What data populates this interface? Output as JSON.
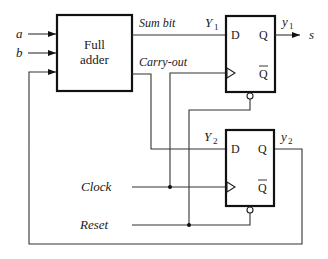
{
  "diagram": {
    "type": "sequential-circuit",
    "full_adder": {
      "label_line1": "Full",
      "label_line2": "adder"
    },
    "inputs": {
      "a": "a",
      "b": "b",
      "clock": "Clock",
      "reset": "Reset"
    },
    "signals": {
      "sum_bit": "Sum bit",
      "carry_out": "Carry-out",
      "Y1": "Y",
      "Y1_sub": "1",
      "Y2": "Y",
      "Y2_sub": "2",
      "y1": "y",
      "y1_sub": "1",
      "y2": "y",
      "y2_sub": "2",
      "output": "s"
    },
    "flip_flop_1": {
      "d": "D",
      "q": "Q",
      "qbar": "Q"
    },
    "flip_flop_2": {
      "d": "D",
      "q": "Q",
      "qbar": "Q"
    },
    "colors": {
      "line": "#333333",
      "box": "#111111",
      "background": "#ffffff"
    }
  }
}
